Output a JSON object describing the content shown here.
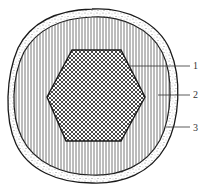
{
  "diagram": {
    "type": "cross-section",
    "layers": [
      {
        "id": 1,
        "label": "1",
        "shape": "hexagon",
        "fill": "crosshatch"
      },
      {
        "id": 2,
        "label": "2",
        "shape": "circle",
        "fill": "vertical-lines"
      },
      {
        "id": 3,
        "label": "3",
        "shape": "ring",
        "fill": "stipple"
      }
    ]
  },
  "colors": {
    "stroke": "#1a1a1a",
    "background": "#ffffff",
    "hatch": "#444444"
  }
}
